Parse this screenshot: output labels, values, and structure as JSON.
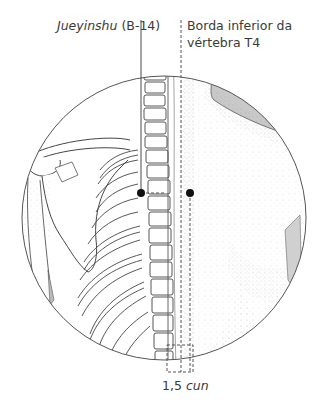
{
  "figure": {
    "point_label": {
      "name_italic": "Jueyinshu",
      "code": "(B-14)"
    },
    "landmark_label": {
      "line1": "Borda inferior da",
      "line2": "vértebra T4"
    },
    "measure_label": {
      "value": "1,5",
      "unit_italic": "cun"
    },
    "colors": {
      "line": "#4a4a4a",
      "text": "#3a3a3a",
      "shade": "#c8c8c8",
      "stipple": "#9a9a9a",
      "point": "#111111",
      "background": "#ffffff"
    },
    "markers": [
      {
        "id": "jueyinshu-point",
        "x": 141,
        "y": 193
      },
      {
        "id": "lateral-point",
        "x": 190,
        "y": 193
      }
    ]
  }
}
